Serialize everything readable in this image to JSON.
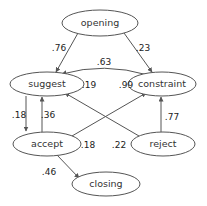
{
  "diagram": {
    "type": "directed-weighted-graph",
    "background_color": "#ffffff",
    "node_stroke_color": "#555555",
    "edge_stroke_color": "#555555",
    "label_color": "#222222",
    "node_shape": "ellipse",
    "nodes": [
      {
        "id": "opening",
        "label": "opening",
        "cx": 100,
        "cy": 23,
        "rx": 38,
        "ry": 13
      },
      {
        "id": "suggest",
        "label": "suggest",
        "cx": 47,
        "cy": 84,
        "rx": 37,
        "ry": 12
      },
      {
        "id": "constraint",
        "label": "constraint",
        "cx": 162,
        "cy": 84,
        "rx": 34,
        "ry": 12
      },
      {
        "id": "accept",
        "label": "accept",
        "cx": 47,
        "cy": 144,
        "rx": 34,
        "ry": 12
      },
      {
        "id": "reject",
        "label": "reject",
        "cx": 163,
        "cy": 144,
        "rx": 32,
        "ry": 12
      },
      {
        "id": "closing",
        "label": "closing",
        "cx": 106,
        "cy": 184,
        "rx": 34,
        "ry": 12
      }
    ],
    "edges": [
      {
        "from": "opening",
        "to": "suggest",
        "weight": ".76",
        "label_x": 59,
        "label_y": 48
      },
      {
        "from": "opening",
        "to": "constraint",
        "weight": ".23",
        "label_x": 143,
        "label_y": 48
      },
      {
        "from": "constraint",
        "to": "suggest",
        "weight": ".63",
        "label_x": 104,
        "label_y": 62
      },
      {
        "from": "reject",
        "to": "suggest",
        "weight": ".19",
        "label_x": 89,
        "label_y": 85
      },
      {
        "from": "accept",
        "to": "constraint",
        "weight": ".99",
        "label_x": 126,
        "label_y": 85
      },
      {
        "from": "suggest",
        "to": "accept",
        "weight": ".18",
        "label_x": 19,
        "label_y": 115
      },
      {
        "from": "accept",
        "to": "suggest",
        "weight": ".36",
        "label_x": 48,
        "label_y": 115
      },
      {
        "from": "reject",
        "to": "constraint",
        "weight": ".77",
        "label_x": 172,
        "label_y": 117
      },
      {
        "from": "accept",
        "to": "suggest",
        "weight": ".18",
        "label_x": 88,
        "label_y": 145
      },
      {
        "from": "reject",
        "to": "constraint",
        "weight": ".22",
        "label_x": 119,
        "label_y": 145
      },
      {
        "from": "accept",
        "to": "closing",
        "weight": ".46",
        "label_x": 49,
        "label_y": 172
      }
    ]
  }
}
